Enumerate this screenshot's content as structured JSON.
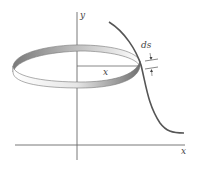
{
  "figure": {
    "labels": {
      "y_axis": "y",
      "x_axis": "x",
      "radius": "x",
      "arc_element": "ds"
    },
    "colors": {
      "axis": "#6a6a6a",
      "curve": "#555555",
      "band_shade_dark": "#808080",
      "band_shade_light": "#f4f4f4",
      "label": "#444444"
    }
  }
}
